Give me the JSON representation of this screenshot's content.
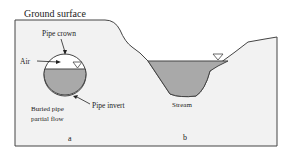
{
  "diagram": {
    "title_label": "Ground surface",
    "panel_a": {
      "label": "a",
      "pipe_crown": "Pipe crown",
      "air": "Air",
      "buried_pipe_line1": "Buried pipe",
      "buried_pipe_line2": "partial flow",
      "pipe_invert": "Pipe invert"
    },
    "panel_b": {
      "label": "b",
      "stream": "Stream"
    },
    "colors": {
      "ground_fill": "#f2f2f2",
      "water_fill": "#a9a9a9",
      "outline": "#444444"
    }
  }
}
